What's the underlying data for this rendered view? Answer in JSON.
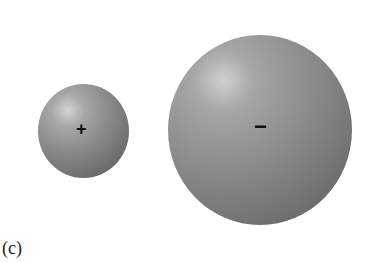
{
  "figure": {
    "label": "(c)",
    "spheres": [
      {
        "name": "small-positive-sphere",
        "sign": "+",
        "color": "#8a8a8a"
      },
      {
        "name": "large-negative-sphere",
        "sign": "−",
        "color": "#8c8c8c"
      }
    ]
  }
}
